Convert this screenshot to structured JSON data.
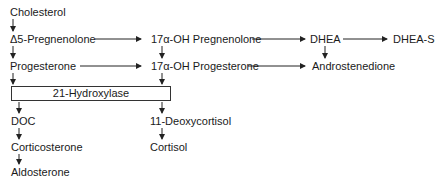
{
  "diagram": {
    "nodes": {
      "cholesterol": "Cholesterol",
      "pregnenolone": "Δ5-Pregnenolone",
      "progesterone": "Progesterone",
      "oh_pregnenolone": "17α-OH Pregnenolone",
      "oh_progesterone": "17α-OH Progesterone",
      "dhea": "DHEA",
      "dhea_s": "DHEA-S",
      "androstenedione": "Androstenedione",
      "doc": "DOC",
      "corticosterone": "Corticosterone",
      "aldosterone": "Aldosterone",
      "deoxycortisol": "11-Deoxycortisol",
      "cortisol": "Cortisol"
    },
    "enzyme_box": "21-Hydroxylase",
    "colors": {
      "text": "#1a1a1a",
      "line": "#333333",
      "background": "#ffffff"
    }
  }
}
